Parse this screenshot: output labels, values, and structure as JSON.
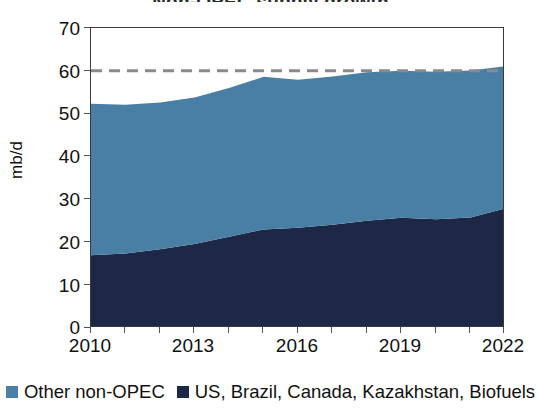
{
  "chart_data": {
    "type": "area",
    "stacked": true,
    "title": "Non-OPEC supply growth",
    "title_clipped": true,
    "xlabel": "",
    "ylabel": "mb/d",
    "ylim": [
      0,
      70
    ],
    "ytick_values": [
      0,
      10,
      20,
      30,
      40,
      50,
      60,
      70
    ],
    "ytick_labels": [
      "0",
      "10",
      "20",
      "30",
      "40",
      "50",
      "60",
      "70"
    ],
    "xlim": [
      2010,
      2022
    ],
    "xtick_labels": [
      "2010",
      "2013",
      "2016",
      "2019",
      "2022"
    ],
    "xtick_values": [
      2010,
      2013,
      2016,
      2019,
      2022
    ],
    "x": [
      2010,
      2011,
      2012,
      2013,
      2014,
      2015,
      2016,
      2017,
      2018,
      2019,
      2020,
      2021,
      2022
    ],
    "grid": false,
    "legend_position": "bottom",
    "series": [
      {
        "name": "US, Brazil, Canada, Kazakhstan, Biofuels",
        "color": "#1d2746",
        "values": [
          17.0,
          17.4,
          18.4,
          19.6,
          21.3,
          23.0,
          23.4,
          24.1,
          25.0,
          25.7,
          25.4,
          25.8,
          27.9
        ]
      },
      {
        "name": "Other non-OPEC",
        "color": "#4a7fa5",
        "values": [
          35.3,
          34.7,
          34.2,
          34.2,
          34.7,
          35.6,
          34.5,
          34.6,
          34.7,
          34.3,
          34.4,
          34.3,
          33.2
        ]
      }
    ],
    "totals": [
      52.3,
      52.1,
      52.6,
      53.8,
      56.0,
      58.6,
      57.9,
      58.7,
      59.7,
      60.0,
      59.8,
      60.1,
      61.1
    ],
    "reference_line": {
      "value": 60,
      "style": "dashed",
      "color": "#8a8a8a",
      "label": ""
    }
  },
  "legend": {
    "items": [
      {
        "label": "Other non-OPEC",
        "color": "#4a7fa5"
      },
      {
        "label": "US, Brazil, Canada, Kazakhstan, Biofuels",
        "color": "#1d2746"
      }
    ]
  },
  "axes": {
    "y_label": "mb/d",
    "y_ticks": [
      "70",
      "60",
      "50",
      "40",
      "30",
      "20",
      "10",
      "0"
    ],
    "x_ticks": [
      "2010",
      "2013",
      "2016",
      "2019",
      "2022"
    ]
  },
  "colors": {
    "light_blue": "#4a7fa5",
    "dark_navy": "#1d2746",
    "frame": "#3a3a3a",
    "dashed": "#8a8a8a",
    "background": "#ffffff"
  }
}
